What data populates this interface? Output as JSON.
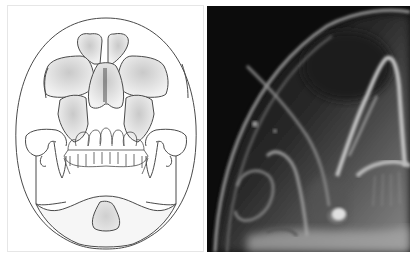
{
  "figure": {
    "panels": [
      {
        "id": "illustration",
        "type": "line-drawing",
        "subject": "skull-frontal-view-schematic",
        "structures": [
          "cranium-outline",
          "frontal-sinus",
          "orbits",
          "nasal-cavity",
          "maxillary-sinuses",
          "zygomatic-arches",
          "coronoid-processes",
          "teeth",
          "mandible",
          "sphenoid-shadow"
        ]
      },
      {
        "id": "radiograph",
        "type": "x-ray",
        "subject": "skull-radiograph-half-axial-view"
      }
    ],
    "colors": {
      "line": "#555555",
      "fill_shade": "#d8d8d8",
      "xray_background": "#101010",
      "xray_bone": "#c8c8c8"
    }
  }
}
